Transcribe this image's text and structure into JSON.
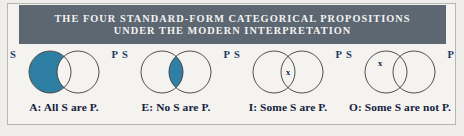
{
  "figure": {
    "title_lines": [
      "THE FOUR STANDARD-FORM CATEGORICAL PROPOSITIONS",
      "UNDER THE MODERN INTERPRETATION"
    ],
    "colors": {
      "header_bg": "#5d6772",
      "header_text": "#f3f3f1",
      "shade_fill": "#2e7fa3",
      "circle_stroke": "#3c3c3c",
      "label_blue": "#1f3a63",
      "caption_text": "#14213d",
      "page_bg": "#efeeea",
      "frame_bg": "#f4f3ef",
      "frame_border": "#b9b7b1"
    }
  },
  "diagrams": [
    {
      "id": "A",
      "caption": "A: All S are P.",
      "left_label": "S",
      "right_label": "P",
      "shaded_region": "s-only",
      "x_region": null,
      "x_mark": ""
    },
    {
      "id": "E",
      "caption": "E: No S are P.",
      "left_label": "S",
      "right_label": "P",
      "shaded_region": "intersection",
      "x_region": null,
      "x_mark": ""
    },
    {
      "id": "I",
      "caption": "I: Some S are P.",
      "left_label": "S",
      "right_label": "P",
      "shaded_region": null,
      "x_region": "intersection",
      "x_mark": "x"
    },
    {
      "id": "O",
      "caption": "O: Some S are not P.",
      "left_label": "S",
      "right_label": "P",
      "shaded_region": null,
      "x_region": "s-only",
      "x_mark": "x"
    }
  ]
}
